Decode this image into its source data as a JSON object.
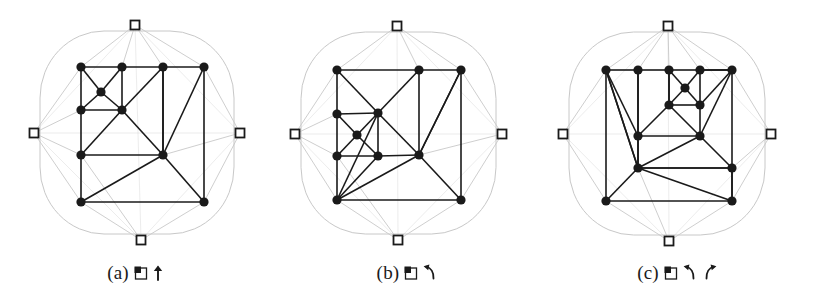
{
  "figure": {
    "background_color": "#ffffff",
    "mesh_color": "#1a1a1a",
    "boundary_color": "#c8c8c8",
    "marker_color": "#1a1a1a",
    "panel_count": 3
  },
  "panels": [
    {
      "id": "panel-a",
      "caption_label": "(a)",
      "caption_glyphs": [
        "square-refine-icon",
        "up-arrow-icon"
      ],
      "caption_text": "(a) ▣↑",
      "boundary_markers": [
        {
          "name": "top-boundary-marker",
          "x": 135,
          "y": 25
        },
        {
          "name": "left-boundary-marker",
          "x": 34,
          "y": 133
        },
        {
          "name": "right-boundary-marker",
          "x": 240,
          "y": 133
        },
        {
          "name": "bottom-boundary-marker",
          "x": 141,
          "y": 240
        }
      ],
      "nodes": [
        {
          "id": 0,
          "x": 81,
          "y": 67
        },
        {
          "id": 1,
          "x": 122,
          "y": 67
        },
        {
          "id": 2,
          "x": 163,
          "y": 67
        },
        {
          "id": 3,
          "x": 204,
          "y": 67
        },
        {
          "id": 4,
          "x": 101,
          "y": 92
        },
        {
          "id": 5,
          "x": 81,
          "y": 110
        },
        {
          "id": 6,
          "x": 122,
          "y": 110
        },
        {
          "id": 7,
          "x": 81,
          "y": 155
        },
        {
          "id": 8,
          "x": 163,
          "y": 155
        },
        {
          "id": 9,
          "x": 81,
          "y": 202
        },
        {
          "id": 10,
          "x": 204,
          "y": 202
        }
      ],
      "edges": [
        [
          0,
          1
        ],
        [
          1,
          2
        ],
        [
          2,
          3
        ],
        [
          0,
          5
        ],
        [
          5,
          7
        ],
        [
          7,
          9
        ],
        [
          3,
          10
        ],
        [
          9,
          10
        ],
        [
          0,
          4
        ],
        [
          1,
          4
        ],
        [
          4,
          5
        ],
        [
          4,
          6
        ],
        [
          1,
          6
        ],
        [
          5,
          6
        ],
        [
          2,
          6
        ],
        [
          6,
          8
        ],
        [
          2,
          8
        ],
        [
          3,
          8
        ],
        [
          8,
          10
        ],
        [
          6,
          7
        ],
        [
          7,
          8
        ],
        [
          8,
          9
        ],
        [
          2,
          8
        ]
      ],
      "boundary_links": [
        [
          0,
          0
        ],
        [
          1,
          0
        ],
        [
          2,
          0
        ],
        [
          3,
          0
        ],
        [
          0,
          1
        ],
        [
          5,
          1
        ],
        [
          7,
          1
        ],
        [
          9,
          1
        ],
        [
          3,
          2
        ],
        [
          10,
          2
        ],
        [
          8,
          2
        ],
        [
          9,
          3
        ],
        [
          10,
          3
        ],
        [
          7,
          3
        ]
      ]
    },
    {
      "id": "panel-b",
      "caption_label": "(b)",
      "caption_glyphs": [
        "square-refine-icon",
        "ccw-arrow-icon"
      ],
      "caption_text": "(b) ▣↶",
      "boundary_markers": [
        {
          "name": "top-boundary-marker",
          "x": 126,
          "y": 26
        },
        {
          "name": "left-boundary-marker",
          "x": 24,
          "y": 134
        },
        {
          "name": "right-boundary-marker",
          "x": 231,
          "y": 134
        },
        {
          "name": "bottom-boundary-marker",
          "x": 127,
          "y": 240
        }
      ],
      "nodes": [
        {
          "id": 0,
          "x": 66,
          "y": 70
        },
        {
          "id": 1,
          "x": 148,
          "y": 70
        },
        {
          "id": 2,
          "x": 190,
          "y": 70
        },
        {
          "id": 3,
          "x": 66,
          "y": 114
        },
        {
          "id": 4,
          "x": 107,
          "y": 113
        },
        {
          "id": 5,
          "x": 86,
          "y": 135
        },
        {
          "id": 6,
          "x": 66,
          "y": 156
        },
        {
          "id": 7,
          "x": 107,
          "y": 156
        },
        {
          "id": 8,
          "x": 148,
          "y": 155
        },
        {
          "id": 9,
          "x": 66,
          "y": 200
        },
        {
          "id": 10,
          "x": 190,
          "y": 200
        }
      ],
      "edges": [
        [
          0,
          1
        ],
        [
          1,
          2
        ],
        [
          0,
          3
        ],
        [
          3,
          6
        ],
        [
          6,
          9
        ],
        [
          2,
          10
        ],
        [
          9,
          10
        ],
        [
          0,
          4
        ],
        [
          3,
          4
        ],
        [
          1,
          4
        ],
        [
          4,
          8
        ],
        [
          1,
          8
        ],
        [
          3,
          5
        ],
        [
          4,
          5
        ],
        [
          5,
          6
        ],
        [
          5,
          7
        ],
        [
          4,
          7
        ],
        [
          6,
          7
        ],
        [
          7,
          8
        ],
        [
          2,
          8
        ],
        [
          8,
          10
        ],
        [
          7,
          9
        ],
        [
          8,
          9
        ],
        [
          9,
          4
        ],
        [
          2,
          8
        ]
      ],
      "boundary_links": [
        [
          0,
          0
        ],
        [
          1,
          0
        ],
        [
          2,
          0
        ],
        [
          0,
          1
        ],
        [
          3,
          1
        ],
        [
          6,
          1
        ],
        [
          9,
          1
        ],
        [
          2,
          2
        ],
        [
          10,
          2
        ],
        [
          8,
          2
        ],
        [
          9,
          3
        ],
        [
          10,
          3
        ],
        [
          6,
          3
        ]
      ]
    },
    {
      "id": "panel-c",
      "caption_label": "(c)",
      "caption_glyphs": [
        "square-refine-icon",
        "ccw-arrow-icon",
        "cw-arrow-icon"
      ],
      "caption_text": "(c) ▣↶ ↷",
      "boundary_markers": [
        {
          "name": "top-boundary-marker",
          "x": 126,
          "y": 26
        },
        {
          "name": "left-boundary-marker",
          "x": 21,
          "y": 134
        },
        {
          "name": "right-boundary-marker",
          "x": 229,
          "y": 134
        },
        {
          "name": "bottom-boundary-marker",
          "x": 127,
          "y": 241
        }
      ],
      "nodes": [
        {
          "id": 0,
          "x": 64,
          "y": 70
        },
        {
          "id": 1,
          "x": 96,
          "y": 70
        },
        {
          "id": 2,
          "x": 127,
          "y": 70
        },
        {
          "id": 3,
          "x": 158,
          "y": 70
        },
        {
          "id": 4,
          "x": 190,
          "y": 70
        },
        {
          "id": 5,
          "x": 143,
          "y": 88
        },
        {
          "id": 6,
          "x": 127,
          "y": 105
        },
        {
          "id": 7,
          "x": 158,
          "y": 105
        },
        {
          "id": 8,
          "x": 96,
          "y": 136
        },
        {
          "id": 9,
          "x": 158,
          "y": 136
        },
        {
          "id": 10,
          "x": 96,
          "y": 168
        },
        {
          "id": 11,
          "x": 190,
          "y": 168
        },
        {
          "id": 12,
          "x": 64,
          "y": 201
        },
        {
          "id": 13,
          "x": 190,
          "y": 201
        }
      ],
      "edges": [
        [
          0,
          1
        ],
        [
          1,
          2
        ],
        [
          2,
          3
        ],
        [
          3,
          4
        ],
        [
          0,
          12
        ],
        [
          4,
          11
        ],
        [
          11,
          13
        ],
        [
          12,
          13
        ],
        [
          0,
          8
        ],
        [
          0,
          10
        ],
        [
          1,
          8
        ],
        [
          1,
          10
        ],
        [
          2,
          6
        ],
        [
          3,
          7
        ],
        [
          2,
          5
        ],
        [
          3,
          5
        ],
        [
          5,
          6
        ],
        [
          5,
          7
        ],
        [
          6,
          7
        ],
        [
          4,
          7
        ],
        [
          4,
          9
        ],
        [
          7,
          9
        ],
        [
          6,
          9
        ],
        [
          6,
          8
        ],
        [
          8,
          9
        ],
        [
          8,
          10
        ],
        [
          9,
          10
        ],
        [
          9,
          11
        ],
        [
          10,
          11
        ],
        [
          10,
          12
        ],
        [
          10,
          13
        ],
        [
          11,
          13
        ],
        [
          2,
          6
        ],
        [
          4,
          3
        ],
        [
          0,
          10
        ],
        [
          10,
          11
        ]
      ],
      "boundary_links": [
        [
          0,
          0
        ],
        [
          1,
          0
        ],
        [
          2,
          0
        ],
        [
          3,
          0
        ],
        [
          4,
          0
        ],
        [
          0,
          1
        ],
        [
          12,
          1
        ],
        [
          4,
          2
        ],
        [
          11,
          2
        ],
        [
          13,
          2
        ],
        [
          12,
          3
        ],
        [
          13,
          3
        ],
        [
          10,
          3
        ]
      ]
    }
  ]
}
